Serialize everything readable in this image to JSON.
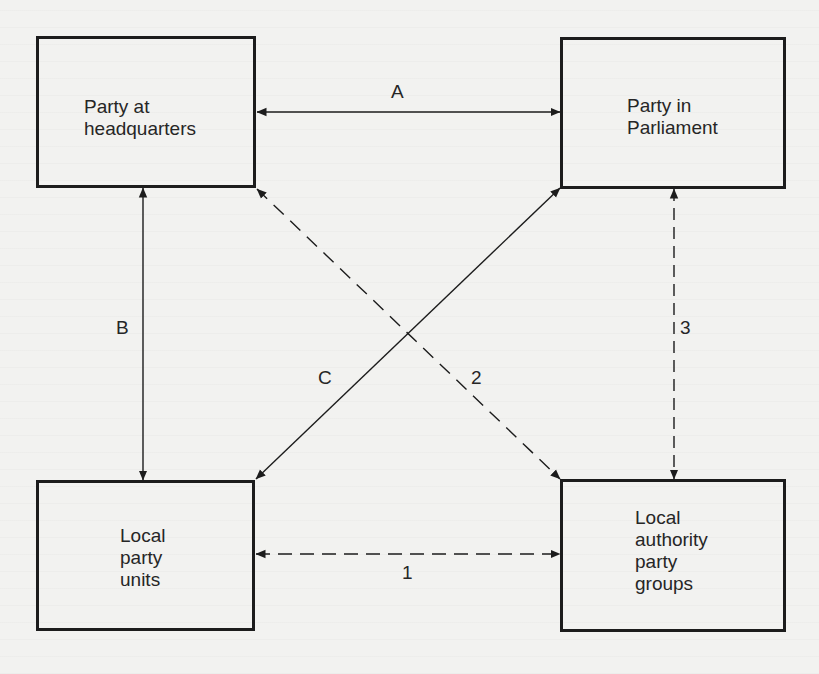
{
  "diagram": {
    "nodes": [
      {
        "id": "hq",
        "label": "Party at\nheadquarters"
      },
      {
        "id": "parliament",
        "label": "Party in\nParliament"
      },
      {
        "id": "local_units",
        "label": "Local\nparty\nunits"
      },
      {
        "id": "la_groups",
        "label": "Local\nauthority\nparty\ngroups"
      }
    ],
    "edges": [
      {
        "id": "A",
        "label": "A",
        "from": "hq",
        "to": "parliament",
        "style": "solid",
        "direction": "both"
      },
      {
        "id": "B",
        "label": "B",
        "from": "hq",
        "to": "local_units",
        "style": "solid",
        "direction": "both"
      },
      {
        "id": "C",
        "label": "C",
        "from": "local_units",
        "to": "parliament",
        "style": "solid",
        "direction": "both"
      },
      {
        "id": "1",
        "label": "1",
        "from": "local_units",
        "to": "la_groups",
        "style": "dashed",
        "direction": "both"
      },
      {
        "id": "2",
        "label": "2",
        "from": "hq",
        "to": "la_groups",
        "style": "dashed",
        "direction": "both"
      },
      {
        "id": "3",
        "label": "3",
        "from": "parliament",
        "to": "la_groups",
        "style": "dashed",
        "direction": "both"
      }
    ]
  },
  "colors": {
    "background": "#f2f2f0",
    "ink": "#1c1c1c"
  }
}
